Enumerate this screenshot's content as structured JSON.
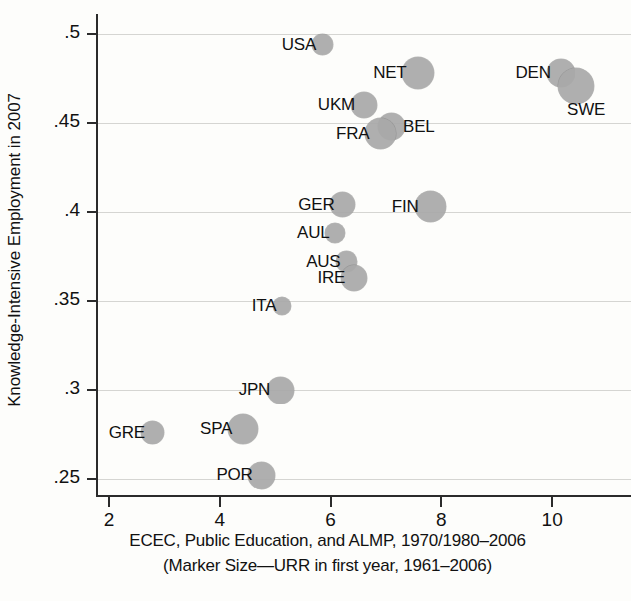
{
  "chart_data": {
    "type": "scatter",
    "title": "",
    "xlabel": "ECEC, Public Education, and ALMP, 1970/1980–2006",
    "xlabel_line2": "(Marker Size—URR in first year, 1961–2006)",
    "ylabel": "Knowledge-Intensive Employment in 2007",
    "xlim": [
      1.2,
      10.6
    ],
    "ylim": [
      0.24,
      0.505
    ],
    "xticks": [
      2,
      4,
      6,
      8,
      10
    ],
    "xtick_labels": [
      "2",
      "4",
      "6",
      "8",
      "10"
    ],
    "yticks": [
      0.25,
      0.3,
      0.35,
      0.4,
      0.45,
      0.5
    ],
    "ytick_labels": [
      ".25",
      ".3",
      ".35",
      ".4",
      ".45",
      ".5"
    ],
    "grid": "horizontal",
    "legend": "none",
    "marker_color": "#a9a9a9",
    "size_encoding": "Marker Size—URR in first year, 1961–2006",
    "points": [
      {
        "label": "USA",
        "x": 5.85,
        "y": 0.494,
        "size": 21,
        "label_side": "left"
      },
      {
        "label": "NET",
        "x": 7.58,
        "y": 0.478,
        "size": 32,
        "label_side": "left"
      },
      {
        "label": "DEN",
        "x": 10.15,
        "y": 0.478,
        "size": 28,
        "label_side": "left"
      },
      {
        "label": "SWE",
        "x": 10.43,
        "y": 0.471,
        "size": 36,
        "label_side": "below-right"
      },
      {
        "label": "UKM",
        "x": 6.6,
        "y": 0.46,
        "size": 26,
        "label_side": "left"
      },
      {
        "label": "BEL",
        "x": 7.1,
        "y": 0.448,
        "size": 27,
        "label_side": "right"
      },
      {
        "label": "FRA",
        "x": 6.9,
        "y": 0.444,
        "size": 31,
        "label_side": "left"
      },
      {
        "label": "GER",
        "x": 6.22,
        "y": 0.404,
        "size": 25,
        "label_side": "left"
      },
      {
        "label": "FIN",
        "x": 7.8,
        "y": 0.403,
        "size": 31,
        "label_side": "left"
      },
      {
        "label": "AUL",
        "x": 6.08,
        "y": 0.388,
        "size": 20,
        "label_side": "left"
      },
      {
        "label": "AUS",
        "x": 6.29,
        "y": 0.372,
        "size": 21,
        "label_side": "left"
      },
      {
        "label": "IRE",
        "x": 6.43,
        "y": 0.363,
        "size": 26,
        "label_side": "left"
      },
      {
        "label": "ITA",
        "x": 5.12,
        "y": 0.347,
        "size": 18,
        "label_side": "left"
      },
      {
        "label": "JPN",
        "x": 5.09,
        "y": 0.3,
        "size": 27,
        "label_side": "left"
      },
      {
        "label": "SPA",
        "x": 4.42,
        "y": 0.278,
        "size": 30,
        "label_side": "left"
      },
      {
        "label": "GRE",
        "x": 2.78,
        "y": 0.276,
        "size": 23,
        "label_side": "left"
      },
      {
        "label": "POR",
        "x": 4.76,
        "y": 0.252,
        "size": 27,
        "label_side": "left"
      }
    ]
  }
}
